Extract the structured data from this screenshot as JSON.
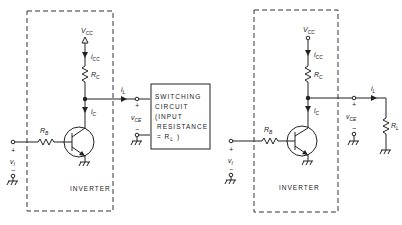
{
  "left_circuit": {
    "vcc": "V",
    "vcc_sub": "CC",
    "icc": "i",
    "icc_sub": "CC",
    "rc": "R",
    "rc_sub": "C",
    "ic": "i",
    "ic_sub": "C",
    "rb": "R",
    "rb_sub": "B",
    "vi": "v",
    "vi_sub": "I",
    "il": "i",
    "il_sub": "L",
    "vce": "v",
    "vce_sub": "CE",
    "plus": "+",
    "minus": "−",
    "block_label": "INVERTER",
    "switching_box": {
      "line1": "SWITCHING",
      "line2": "CIRCUIT",
      "line3": "(INPUT",
      "line4": "RESISTANCE",
      "line5": "= R",
      "line5_sub": "L",
      "line5_end": " )"
    }
  },
  "right_circuit": {
    "vcc": "V",
    "vcc_sub": "CC",
    "icc": "i",
    "icc_sub": "CC",
    "rc": "R",
    "rc_sub": "C",
    "ic": "i",
    "ic_sub": "C",
    "rb": "R",
    "rb_sub": "B",
    "vi": "v",
    "vi_sub": "I",
    "il": "i",
    "il_sub": "L",
    "vce": "v",
    "vce_sub": "CE",
    "rl": "R",
    "rl_sub": "L",
    "plus": "+",
    "minus": "−",
    "block_label": "INVERTER"
  }
}
